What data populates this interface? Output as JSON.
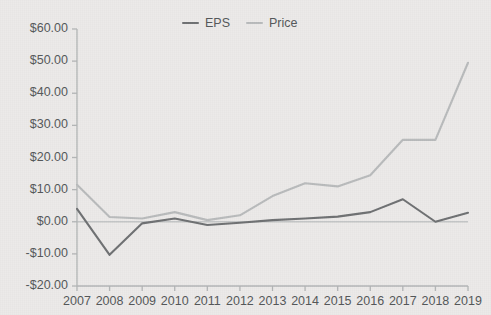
{
  "chart_data": {
    "type": "line",
    "title": "",
    "xlabel": "",
    "ylabel": "",
    "categories": [
      "2007",
      "2008",
      "2009",
      "2010",
      "2011",
      "2012",
      "2013",
      "2014",
      "2015",
      "2016",
      "2017",
      "2018",
      "2019"
    ],
    "x": [
      2007,
      2008,
      2009,
      2010,
      2011,
      2012,
      2013,
      2014,
      2015,
      2016,
      2017,
      2018,
      2019
    ],
    "series": [
      {
        "name": "EPS",
        "color": "#6f7173",
        "values": [
          4.0,
          -10.3,
          -0.5,
          1.0,
          -1.0,
          -0.3,
          0.5,
          1.0,
          1.6,
          3.0,
          7.0,
          0.0,
          2.8
        ]
      },
      {
        "name": "Price",
        "color": "#b9bbbc",
        "values": [
          11.5,
          1.5,
          1.0,
          3.0,
          0.5,
          2.0,
          8.0,
          12.0,
          11.0,
          14.5,
          25.5,
          25.5,
          49.5
        ]
      }
    ],
    "ylim": [
      -20,
      60
    ],
    "ytick_values": [
      60,
      50,
      40,
      30,
      20,
      10,
      0,
      -10,
      -20
    ],
    "ytick_labels": [
      "$60.00",
      "$50.00",
      "$40.00",
      "$30.00",
      "$20.00",
      "$10.00",
      "$0.00",
      "-$10.00",
      "-$20.00"
    ],
    "xtick_labels": [
      "2007",
      "2008",
      "2009",
      "2010",
      "2011",
      "2012",
      "2013",
      "2014",
      "2015",
      "2016",
      "2017",
      "2018",
      "2019"
    ],
    "grid": false,
    "zero_line": true,
    "legend_position": "top-center",
    "legend": [
      "EPS",
      "Price"
    ]
  },
  "legend": {
    "items": [
      {
        "label": "EPS",
        "color": "#6f7173"
      },
      {
        "label": "Price",
        "color": "#b9bbbc"
      }
    ]
  },
  "axes": {
    "axis_color": "#b3b5b6",
    "tick_color": "#b3b5b6",
    "label_color": "#55585a",
    "background": "#eceae9"
  }
}
